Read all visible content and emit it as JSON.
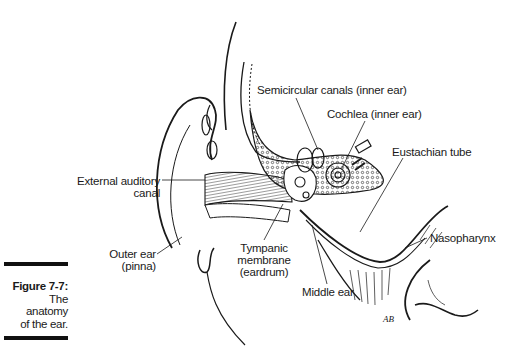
{
  "figure": {
    "number_label": "Figure 7-7:",
    "caption_lines": [
      "The",
      "anatomy",
      "of the ear."
    ],
    "artist_initials": "AB"
  },
  "labels": {
    "semicircular_canals": "Semicircular canals (inner ear)",
    "cochlea": "Cochlea (inner ear)",
    "eustachian_tube": "Eustachian tube",
    "external_auditory_canal": [
      "External auditory",
      "canal"
    ],
    "nasopharynx": "Nasopharynx",
    "outer_ear": [
      "Outer ear",
      "(pinna)"
    ],
    "tympanic_membrane": [
      "Tympanic",
      "membrane",
      "(eardrum)"
    ],
    "middle_ear": "Middle ear"
  },
  "colors": {
    "ink": "#1a1a1a",
    "background": "#ffffff"
  }
}
